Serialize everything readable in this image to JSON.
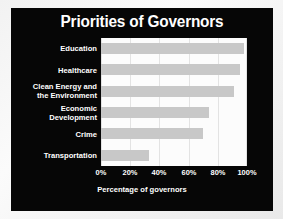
{
  "chart_data": {
    "type": "bar",
    "orientation": "horizontal",
    "title": "Priorities of Governors",
    "xlabel": "Percentage of governors",
    "ylabel": "",
    "categories": [
      "Education",
      "Healthcare",
      "Clean Energy and\nthe Environment",
      "Economic\nDevelopment",
      "Crime",
      "Transportation"
    ],
    "values": [
      98,
      95,
      91,
      74,
      70,
      33
    ],
    "xlim": [
      0,
      100
    ],
    "xticks": [
      0,
      20,
      40,
      60,
      80,
      100
    ],
    "xtick_labels": [
      "0%",
      "20%",
      "40%",
      "60%",
      "80%",
      "100%"
    ],
    "grid": "vertical",
    "legend": "none",
    "bar_color": "#c8c8c8",
    "plot_background": "#fcfcfc",
    "panel_background": "#060606",
    "text_color": "#ffffff"
  }
}
